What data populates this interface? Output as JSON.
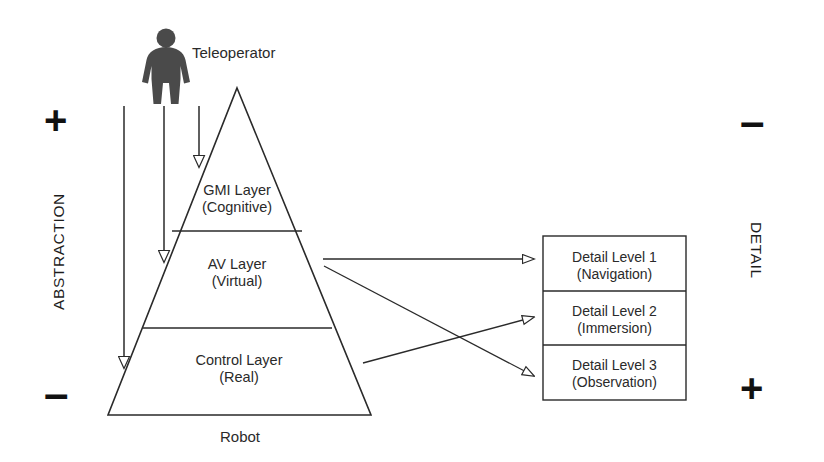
{
  "figure": {
    "colors": {
      "stroke": "#2a2a2a",
      "text": "#2a2a2a",
      "figure_fill": "#4a4a4a",
      "background": "#ffffff"
    }
  },
  "nodes": {
    "teleoperator_label": "Teleoperator",
    "robot_label": "Robot"
  },
  "pyramid": {
    "layers": [
      {
        "name": "GMI Layer",
        "qualifier": "(Cognitive)"
      },
      {
        "name": "AV Layer",
        "qualifier": "(Virtual)"
      },
      {
        "name": "Control Layer",
        "qualifier": "(Real)"
      }
    ]
  },
  "detail_panel": {
    "levels": [
      {
        "name": "Detail Level 1",
        "qualifier": "(Navigation)"
      },
      {
        "name": "Detail Level 2",
        "qualifier": "(Immersion)"
      },
      {
        "name": "Detail Level 3",
        "qualifier": "(Observation)"
      }
    ]
  },
  "axes": {
    "left": {
      "label": "ABSTRACTION",
      "top_sign": "+",
      "bottom_sign": "–"
    },
    "right": {
      "label": "DETAIL",
      "top_sign": "–",
      "bottom_sign": "+"
    }
  }
}
